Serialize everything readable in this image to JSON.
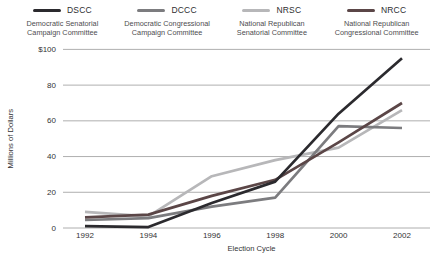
{
  "legend": {
    "items": [
      {
        "acronym": "DSCC",
        "name_line1": "Democratic Senatorial",
        "name_line2": "Campaign Committee",
        "color": "#2b2a2e"
      },
      {
        "acronym": "DCCC",
        "name_line1": "Democratic Congressional",
        "name_line2": "Campaign Committee",
        "color": "#7c7c7f"
      },
      {
        "acronym": "NRSC",
        "name_line1": "National Republican",
        "name_line2": "Senatorial Committee",
        "color": "#b7b7b9"
      },
      {
        "acronym": "NRCC",
        "name_line1": "National Republican",
        "name_line2": "Congressional Committee",
        "color": "#5b4647"
      }
    ]
  },
  "chart_data": {
    "type": "line",
    "x": [
      1992,
      1994,
      1996,
      1998,
      2000,
      2002
    ],
    "x_tick_labels": [
      "1992",
      "1994",
      "1996",
      "1998",
      "2000",
      "2002"
    ],
    "series": [
      {
        "name": "DSCC",
        "color": "#2b2a2e",
        "values": [
          1,
          0.5,
          14,
          26,
          64,
          95
        ]
      },
      {
        "name": "DCCC",
        "color": "#7c7c7f",
        "values": [
          4.5,
          5.5,
          12,
          17,
          57,
          56
        ]
      },
      {
        "name": "NRSC",
        "color": "#b7b7b9",
        "values": [
          9,
          6.5,
          29,
          38,
          45,
          66
        ]
      },
      {
        "name": "NRCC",
        "color": "#5b4647",
        "values": [
          6,
          7.5,
          18,
          27,
          48,
          70
        ]
      }
    ],
    "xlabel": "Election Cycle",
    "ylabel": "Millions of Dollars",
    "y_ticks": [
      0,
      20,
      40,
      60,
      80,
      100
    ],
    "y_tick_labels": [
      "0",
      "20",
      "40",
      "60",
      "80",
      "$100"
    ],
    "ylim": [
      0,
      100
    ],
    "grid": "horizontal",
    "legend_position": "top",
    "draw_order": [
      2,
      1,
      3,
      0
    ]
  }
}
